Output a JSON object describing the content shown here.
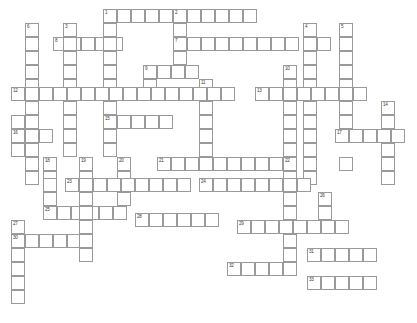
{
  "puzzle": {
    "title": "Crossword Puzzle Grid",
    "type": "crossword",
    "width_px": 417,
    "height_px": 323,
    "cell_size_px": 14,
    "origin_x": 11,
    "origin_y": 9,
    "cols": 28,
    "rows": 21,
    "grid_color": "#9a9a9a",
    "cell_fill": "#ffffff",
    "background": "#ffffff",
    "number_color": "#3a3a3a",
    "entries": [
      {
        "number": 1,
        "direction": "across",
        "col": 6,
        "row": 0,
        "length": 8
      },
      {
        "number": 1,
        "direction": "down",
        "col": 6,
        "row": 0,
        "length": 4
      },
      {
        "number": 2,
        "direction": "down",
        "col": 11,
        "row": 0,
        "length": 11
      },
      {
        "number": 3,
        "direction": "down",
        "col": 3,
        "row": 1,
        "length": 9
      },
      {
        "number": 4,
        "direction": "down",
        "col": 15,
        "row": 1,
        "length": 10
      },
      {
        "number": 5,
        "direction": "down",
        "col": 18,
        "row": 1,
        "length": 9
      },
      {
        "number": 6,
        "direction": "down",
        "col": 1,
        "row": 1,
        "length": 10
      },
      {
        "number": 7,
        "direction": "across",
        "col": 11,
        "row": 2,
        "length": 12
      },
      {
        "number": 8,
        "direction": "across",
        "col": 2,
        "row": 2,
        "length": 5
      },
      {
        "number": 9,
        "direction": "across",
        "col": 8,
        "row": 4,
        "length": 4
      },
      {
        "number": 10,
        "direction": "down",
        "col": 15,
        "row": 4,
        "length": 7
      },
      {
        "number": 11,
        "direction": "down",
        "col": 10,
        "row": 5,
        "length": 5
      },
      {
        "number": 12,
        "direction": "across",
        "col": 0,
        "row": 6,
        "length": 16
      },
      {
        "number": 13,
        "direction": "across",
        "col": 13,
        "row": 6,
        "length": 8
      },
      {
        "number": 14,
        "direction": "down",
        "col": 22,
        "row": 7,
        "length": 4
      },
      {
        "number": 15,
        "direction": "across",
        "col": 6,
        "row": 8,
        "length": 5
      },
      {
        "number": 16,
        "direction": "across",
        "col": 0,
        "row": 9,
        "length": 3
      },
      {
        "number": 17,
        "direction": "across",
        "col": 19,
        "row": 9,
        "length": 4
      },
      {
        "number": 18,
        "direction": "down",
        "col": 2,
        "row": 11,
        "length": 6
      },
      {
        "number": 19,
        "direction": "down",
        "col": 5,
        "row": 11,
        "length": 9
      },
      {
        "number": 20,
        "direction": "down",
        "col": 8,
        "row": 11,
        "length": 4
      },
      {
        "number": 21,
        "direction": "across",
        "col": 10,
        "row": 11,
        "length": 10
      },
      {
        "number": 22,
        "direction": "down",
        "col": 19,
        "row": 11,
        "length": 10
      },
      {
        "number": 23,
        "direction": "across",
        "col": 3,
        "row": 12,
        "length": 9
      },
      {
        "number": 24,
        "direction": "across",
        "col": 13,
        "row": 13,
        "length": 8
      },
      {
        "number": 25,
        "direction": "down",
        "col": 22,
        "row": 13,
        "length": 3
      },
      {
        "number": 26,
        "direction": "across",
        "col": 2,
        "row": 14,
        "length": 6
      },
      {
        "number": 27,
        "direction": "down",
        "col": 0,
        "row": 15,
        "length": 7
      },
      {
        "number": 28,
        "direction": "across",
        "col": 8,
        "row": 15,
        "length": 4
      },
      {
        "number": 29,
        "direction": "across",
        "col": 16,
        "row": 15,
        "length": 8
      },
      {
        "number": 30,
        "direction": "across",
        "col": 0,
        "row": 16,
        "length": 5
      },
      {
        "number": 31,
        "direction": "across",
        "col": 21,
        "row": 17,
        "length": 5
      },
      {
        "number": 32,
        "direction": "across",
        "col": 15,
        "row": 18,
        "length": 5
      },
      {
        "number": 33,
        "direction": "across",
        "col": 21,
        "row": 19,
        "length": 5
      }
    ],
    "cells": [
      {
        "x": 103,
        "y": 9,
        "n": "1"
      },
      {
        "x": 117,
        "y": 9
      },
      {
        "x": 131,
        "y": 9
      },
      {
        "x": 145,
        "y": 9
      },
      {
        "x": 159,
        "y": 9
      },
      {
        "x": 173,
        "y": 9,
        "n": "2"
      },
      {
        "x": 187,
        "y": 9
      },
      {
        "x": 201,
        "y": 9
      },
      {
        "x": 215,
        "y": 9
      },
      {
        "x": 229,
        "y": 9
      },
      {
        "x": 243,
        "y": 9
      },
      {
        "x": 25,
        "y": 23,
        "n": "6"
      },
      {
        "x": 63,
        "y": 23,
        "n": "3"
      },
      {
        "x": 103,
        "y": 23
      },
      {
        "x": 173,
        "y": 23
      },
      {
        "x": 303,
        "y": 23,
        "n": "4"
      },
      {
        "x": 339,
        "y": 23,
        "n": "5"
      },
      {
        "x": 25,
        "y": 37
      },
      {
        "x": 53,
        "y": 37,
        "n": "8"
      },
      {
        "x": 67,
        "y": 37
      },
      {
        "x": 81,
        "y": 37
      },
      {
        "x": 95,
        "y": 37
      },
      {
        "x": 109,
        "y": 37
      },
      {
        "x": 63,
        "y": 37
      },
      {
        "x": 103,
        "y": 37
      },
      {
        "x": 173,
        "y": 37,
        "n": "7"
      },
      {
        "x": 187,
        "y": 37
      },
      {
        "x": 201,
        "y": 37
      },
      {
        "x": 215,
        "y": 37
      },
      {
        "x": 229,
        "y": 37
      },
      {
        "x": 243,
        "y": 37
      },
      {
        "x": 257,
        "y": 37
      },
      {
        "x": 271,
        "y": 37
      },
      {
        "x": 285,
        "y": 37
      },
      {
        "x": 303,
        "y": 37
      },
      {
        "x": 317,
        "y": 37
      },
      {
        "x": 339,
        "y": 37
      },
      {
        "x": 25,
        "y": 51
      },
      {
        "x": 63,
        "y": 51
      },
      {
        "x": 103,
        "y": 51
      },
      {
        "x": 173,
        "y": 51
      },
      {
        "x": 303,
        "y": 51
      },
      {
        "x": 339,
        "y": 51
      },
      {
        "x": 25,
        "y": 65
      },
      {
        "x": 63,
        "y": 65
      },
      {
        "x": 103,
        "y": 65
      },
      {
        "x": 143,
        "y": 65,
        "n": "9"
      },
      {
        "x": 157,
        "y": 65
      },
      {
        "x": 171,
        "y": 65
      },
      {
        "x": 185,
        "y": 65
      },
      {
        "x": 283,
        "y": 65,
        "n": "10"
      },
      {
        "x": 303,
        "y": 65
      },
      {
        "x": 339,
        "y": 65
      },
      {
        "x": 25,
        "y": 79
      },
      {
        "x": 63,
        "y": 79
      },
      {
        "x": 103,
        "y": 79
      },
      {
        "x": 143,
        "y": 79
      },
      {
        "x": 199,
        "y": 79,
        "n": "11"
      },
      {
        "x": 283,
        "y": 79
      },
      {
        "x": 303,
        "y": 79
      },
      {
        "x": 339,
        "y": 79
      },
      {
        "x": 11,
        "y": 87,
        "n": "12"
      },
      {
        "x": 25,
        "y": 87
      },
      {
        "x": 39,
        "y": 87
      },
      {
        "x": 53,
        "y": 87
      },
      {
        "x": 67,
        "y": 87
      },
      {
        "x": 81,
        "y": 87
      },
      {
        "x": 95,
        "y": 87
      },
      {
        "x": 109,
        "y": 87
      },
      {
        "x": 123,
        "y": 87
      },
      {
        "x": 137,
        "y": 87
      },
      {
        "x": 151,
        "y": 87
      },
      {
        "x": 165,
        "y": 87
      },
      {
        "x": 179,
        "y": 87
      },
      {
        "x": 193,
        "y": 87
      },
      {
        "x": 207,
        "y": 87
      },
      {
        "x": 221,
        "y": 87
      },
      {
        "x": 255,
        "y": 87,
        "n": "13"
      },
      {
        "x": 269,
        "y": 87
      },
      {
        "x": 283,
        "y": 87
      },
      {
        "x": 297,
        "y": 87
      },
      {
        "x": 311,
        "y": 87
      },
      {
        "x": 325,
        "y": 87
      },
      {
        "x": 339,
        "y": 87
      },
      {
        "x": 353,
        "y": 87
      },
      {
        "x": 25,
        "y": 101
      },
      {
        "x": 63,
        "y": 101
      },
      {
        "x": 103,
        "y": 101
      },
      {
        "x": 199,
        "y": 101
      },
      {
        "x": 283,
        "y": 101
      },
      {
        "x": 303,
        "y": 101
      },
      {
        "x": 339,
        "y": 101
      },
      {
        "x": 381,
        "y": 101,
        "n": "14"
      },
      {
        "x": 11,
        "y": 115
      },
      {
        "x": 25,
        "y": 115
      },
      {
        "x": 63,
        "y": 115
      },
      {
        "x": 103,
        "y": 115,
        "n": "15"
      },
      {
        "x": 117,
        "y": 115
      },
      {
        "x": 131,
        "y": 115
      },
      {
        "x": 145,
        "y": 115
      },
      {
        "x": 159,
        "y": 115
      },
      {
        "x": 199,
        "y": 115
      },
      {
        "x": 283,
        "y": 115
      },
      {
        "x": 303,
        "y": 115
      },
      {
        "x": 339,
        "y": 115
      },
      {
        "x": 381,
        "y": 115
      },
      {
        "x": 11,
        "y": 129,
        "n": "16"
      },
      {
        "x": 25,
        "y": 129
      },
      {
        "x": 39,
        "y": 129
      },
      {
        "x": 63,
        "y": 129
      },
      {
        "x": 103,
        "y": 129
      },
      {
        "x": 199,
        "y": 129
      },
      {
        "x": 283,
        "y": 129
      },
      {
        "x": 303,
        "y": 129
      },
      {
        "x": 335,
        "y": 129,
        "n": "17"
      },
      {
        "x": 349,
        "y": 129
      },
      {
        "x": 363,
        "y": 129
      },
      {
        "x": 377,
        "y": 129
      },
      {
        "x": 391,
        "y": 129
      },
      {
        "x": 11,
        "y": 143
      },
      {
        "x": 25,
        "y": 143
      },
      {
        "x": 63,
        "y": 143
      },
      {
        "x": 103,
        "y": 143
      },
      {
        "x": 199,
        "y": 143
      },
      {
        "x": 283,
        "y": 143
      },
      {
        "x": 303,
        "y": 143
      },
      {
        "x": 381,
        "y": 143
      },
      {
        "x": 43,
        "y": 157,
        "n": "18"
      },
      {
        "x": 79,
        "y": 157,
        "n": "19"
      },
      {
        "x": 25,
        "y": 157
      },
      {
        "x": 117,
        "y": 157,
        "n": "20"
      },
      {
        "x": 157,
        "y": 157,
        "n": "21"
      },
      {
        "x": 171,
        "y": 157
      },
      {
        "x": 185,
        "y": 157
      },
      {
        "x": 199,
        "y": 157
      },
      {
        "x": 213,
        "y": 157
      },
      {
        "x": 227,
        "y": 157
      },
      {
        "x": 241,
        "y": 157
      },
      {
        "x": 255,
        "y": 157
      },
      {
        "x": 269,
        "y": 157
      },
      {
        "x": 283,
        "y": 157,
        "n": "22"
      },
      {
        "x": 303,
        "y": 157
      },
      {
        "x": 339,
        "y": 157
      },
      {
        "x": 381,
        "y": 157
      },
      {
        "x": 43,
        "y": 171
      },
      {
        "x": 79,
        "y": 171
      },
      {
        "x": 25,
        "y": 171
      },
      {
        "x": 117,
        "y": 171
      },
      {
        "x": 283,
        "y": 171
      },
      {
        "x": 303,
        "y": 171
      },
      {
        "x": 381,
        "y": 171
      },
      {
        "x": 43,
        "y": 178
      },
      {
        "x": 65,
        "y": 178,
        "n": "23"
      },
      {
        "x": 79,
        "y": 178
      },
      {
        "x": 93,
        "y": 178
      },
      {
        "x": 107,
        "y": 178
      },
      {
        "x": 121,
        "y": 178
      },
      {
        "x": 135,
        "y": 178
      },
      {
        "x": 149,
        "y": 178
      },
      {
        "x": 163,
        "y": 178
      },
      {
        "x": 177,
        "y": 178
      },
      {
        "x": 199,
        "y": 178,
        "n": "24"
      },
      {
        "x": 213,
        "y": 178
      },
      {
        "x": 227,
        "y": 178
      },
      {
        "x": 241,
        "y": 178
      },
      {
        "x": 255,
        "y": 178
      },
      {
        "x": 269,
        "y": 178
      },
      {
        "x": 283,
        "y": 178
      },
      {
        "x": 297,
        "y": 178
      },
      {
        "x": 43,
        "y": 192
      },
      {
        "x": 79,
        "y": 192
      },
      {
        "x": 117,
        "y": 192
      },
      {
        "x": 283,
        "y": 192
      },
      {
        "x": 318,
        "y": 192,
        "n": "26"
      },
      {
        "x": 43,
        "y": 206,
        "n": "25"
      },
      {
        "x": 57,
        "y": 206
      },
      {
        "x": 71,
        "y": 206
      },
      {
        "x": 85,
        "y": 206
      },
      {
        "x": 99,
        "y": 206
      },
      {
        "x": 113,
        "y": 206
      },
      {
        "x": 79,
        "y": 206
      },
      {
        "x": 283,
        "y": 206
      },
      {
        "x": 318,
        "y": 206
      },
      {
        "x": 11,
        "y": 220,
        "n": "27"
      },
      {
        "x": 79,
        "y": 220
      },
      {
        "x": 237,
        "y": 220,
        "n": "29"
      },
      {
        "x": 251,
        "y": 220
      },
      {
        "x": 265,
        "y": 220
      },
      {
        "x": 279,
        "y": 220
      },
      {
        "x": 293,
        "y": 220
      },
      {
        "x": 307,
        "y": 220
      },
      {
        "x": 321,
        "y": 220
      },
      {
        "x": 335,
        "y": 220
      },
      {
        "x": 135,
        "y": 213,
        "n": "28"
      },
      {
        "x": 149,
        "y": 213
      },
      {
        "x": 163,
        "y": 213
      },
      {
        "x": 177,
        "y": 213
      },
      {
        "x": 191,
        "y": 213
      },
      {
        "x": 205,
        "y": 213
      },
      {
        "x": 11,
        "y": 234,
        "n": "30"
      },
      {
        "x": 25,
        "y": 234
      },
      {
        "x": 39,
        "y": 234
      },
      {
        "x": 53,
        "y": 234
      },
      {
        "x": 67,
        "y": 234
      },
      {
        "x": 79,
        "y": 234
      },
      {
        "x": 283,
        "y": 234
      },
      {
        "x": 11,
        "y": 248
      },
      {
        "x": 79,
        "y": 248
      },
      {
        "x": 283,
        "y": 248
      },
      {
        "x": 307,
        "y": 248,
        "n": "31"
      },
      {
        "x": 321,
        "y": 248
      },
      {
        "x": 335,
        "y": 248
      },
      {
        "x": 349,
        "y": 248
      },
      {
        "x": 363,
        "y": 248
      },
      {
        "x": 11,
        "y": 262
      },
      {
        "x": 227,
        "y": 262,
        "n": "32"
      },
      {
        "x": 241,
        "y": 262
      },
      {
        "x": 255,
        "y": 262
      },
      {
        "x": 269,
        "y": 262
      },
      {
        "x": 283,
        "y": 262
      },
      {
        "x": 11,
        "y": 276
      },
      {
        "x": 307,
        "y": 276,
        "n": "33"
      },
      {
        "x": 321,
        "y": 276
      },
      {
        "x": 335,
        "y": 276
      },
      {
        "x": 349,
        "y": 276
      },
      {
        "x": 363,
        "y": 276
      },
      {
        "x": 11,
        "y": 290
      }
    ]
  }
}
